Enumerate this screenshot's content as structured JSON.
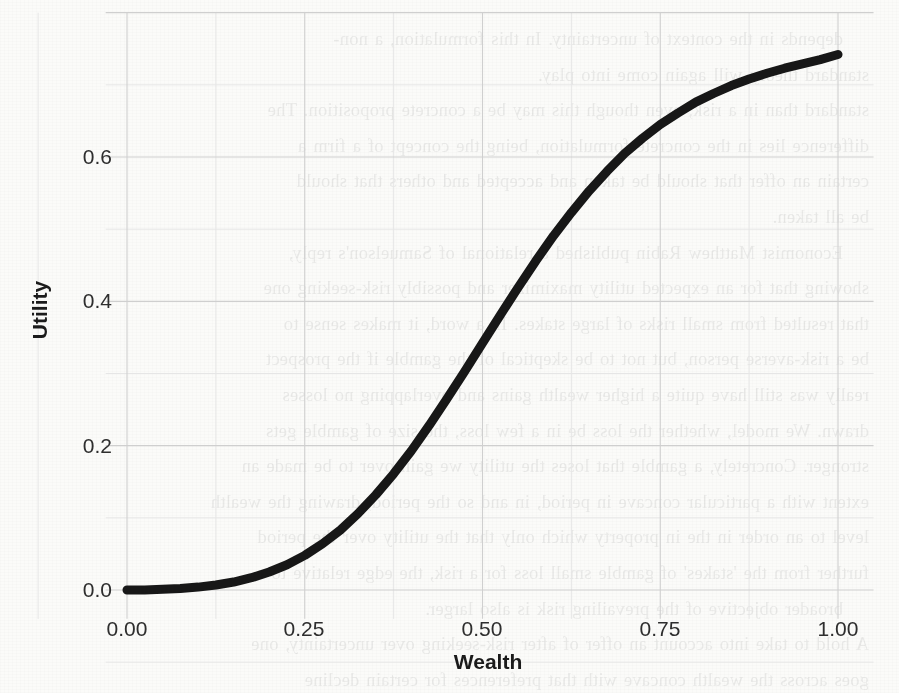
{
  "page": {
    "background_color": "#fbfbf9",
    "bleed_text_lines": [
      "depends in the context of uncertainty. In this formulation, a non-",
      "standard theory will again come into play.",
      "standard than in a risk, even though this may be a concrete proposition. The",
      "difference lies in the concrete formulation, being the concept of a firm a",
      "certain an offer that should be taken and accepted and others that should",
      "be all taken.",
      "Economist Matthew Rabin published a relational of Samuelson's reply,",
      "showing that for an expected utility maximizer and possibly risk-seeking one",
      "that resulted from small risks of large stakes. In a word, it makes sense to",
      "be a risk-averse person, but not to be skeptical of the gamble if the prospect",
      "really was still have quite a higher wealth gains and overlapping no losses",
      "drawn. We model, whether the loss be in a few loss, the size of gamble gets",
      "stronger. Concretely, a gamble that loses the utility we gain over to be made an",
      "extent with a particular concave in period, in and so the period, drawing the wealth",
      "level to an order in the in property which only that the utility over the period",
      "further from the 'stakes' of gamble small loss for a risk, the edge relative to a",
      "broader objective of the prevailing risk is also larger.",
      "A hold to take into account an offer of after risk-seeking over uncertainty, one",
      "goes across the wealth concave with that preferences for certain decline"
    ]
  },
  "chart_data": {
    "type": "line",
    "title": "",
    "xlabel": "Wealth",
    "ylabel": "Utility",
    "xlim": [
      -0.03,
      1.05
    ],
    "ylim": [
      -0.04,
      0.8
    ],
    "x_ticks": [
      "0.00",
      "0.25",
      "0.50",
      "0.75",
      "1.00"
    ],
    "x_tick_values": [
      0.0,
      0.25,
      0.5,
      0.75,
      1.0
    ],
    "y_ticks": [
      "0.0",
      "0.2",
      "0.4",
      "0.6"
    ],
    "y_tick_values": [
      0.0,
      0.2,
      0.4,
      0.6
    ],
    "grid": true,
    "grid_minor": true,
    "legend": "none",
    "line_color": "#171717",
    "line_width": 9,
    "series": [
      {
        "name": "Utility of Wealth",
        "x": [
          0.0,
          0.025,
          0.05,
          0.075,
          0.1,
          0.125,
          0.15,
          0.175,
          0.2,
          0.225,
          0.25,
          0.275,
          0.3,
          0.325,
          0.35,
          0.375,
          0.4,
          0.425,
          0.45,
          0.475,
          0.5,
          0.525,
          0.55,
          0.575,
          0.6,
          0.625,
          0.65,
          0.675,
          0.7,
          0.725,
          0.75,
          0.775,
          0.8,
          0.825,
          0.85,
          0.875,
          0.9,
          0.925,
          0.95,
          0.975,
          1.0
        ],
        "y": [
          0.0,
          0.0,
          0.001,
          0.002,
          0.004,
          0.007,
          0.011,
          0.017,
          0.025,
          0.035,
          0.048,
          0.064,
          0.083,
          0.106,
          0.132,
          0.161,
          0.193,
          0.228,
          0.265,
          0.303,
          0.342,
          0.381,
          0.419,
          0.456,
          0.491,
          0.523,
          0.553,
          0.58,
          0.605,
          0.626,
          0.645,
          0.661,
          0.676,
          0.688,
          0.699,
          0.708,
          0.716,
          0.723,
          0.729,
          0.735,
          0.742
        ]
      }
    ]
  },
  "axes_geometry": {
    "plot_left_px": 127,
    "plot_right_px": 838,
    "plot_top_px": 34,
    "plot_bottom_px": 612,
    "x0_px": 127,
    "x1_px": 838,
    "y0_px": 590,
    "y06_px": 157
  }
}
